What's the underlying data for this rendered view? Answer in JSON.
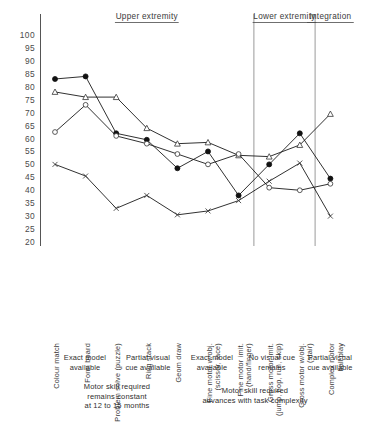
{
  "chart_data": {
    "type": "line",
    "title": "",
    "subtitle": "",
    "xlabel": "",
    "ylabel": "",
    "ylim": [
      20,
      100
    ],
    "ytick_step": 5,
    "grid": false,
    "legend_position": "none",
    "yticks": [
      "100",
      "95",
      "90",
      "85",
      "80",
      "75",
      "70",
      "65",
      "60",
      "55",
      "50",
      "45",
      "40",
      "35",
      "30",
      "25",
      "20"
    ],
    "categories": [
      "Colour match",
      "Form board",
      "Problem solve (puzzle)",
      "Ring stack",
      "Geom draw",
      "Fine motor w/obj. (scissor, lace)",
      "Fine motor imit. (hand/finger)",
      "Gross motor imit. (jump, hop, run, skip)",
      "Gross motor w/obj. (stair)",
      "Complex motor ball play"
    ],
    "category_lines": [
      [
        "Colour match"
      ],
      [
        "Form board"
      ],
      [
        "Problem solve (puzzle)"
      ],
      [
        "Ring stack"
      ],
      [
        "Geom draw"
      ],
      [
        "Fine motor w/obj.",
        "(scissor, lace)"
      ],
      [
        "Fine motor imit.",
        "(hand/finger)"
      ],
      [
        "Gross motor imit.",
        "(jump, hop, run, skip)"
      ],
      [
        "Gross motor w/obj.",
        "(stair)"
      ],
      [
        "Complex motor",
        "ball play"
      ]
    ],
    "series": [
      {
        "name": "filled-circle",
        "marker": "filled-circle",
        "values": [
          83,
          84,
          62,
          59.5,
          48.5,
          55,
          38,
          50,
          62,
          44.5
        ]
      },
      {
        "name": "open-triangle",
        "marker": "open-triangle",
        "values": [
          78,
          76,
          76,
          64,
          58,
          58.5,
          53.5,
          53,
          57.5,
          69.5
        ]
      },
      {
        "name": "open-circle",
        "marker": "open-circle",
        "values": [
          62.5,
          73,
          61,
          58,
          54,
          50,
          54,
          41,
          40,
          42.5
        ]
      },
      {
        "name": "cross-x",
        "marker": "cross-x",
        "values": [
          50,
          45.5,
          33,
          38,
          30.5,
          32,
          36,
          43.5,
          50.5,
          30
        ]
      }
    ],
    "sections": [
      {
        "label": "Upper extremity",
        "start_index": 0,
        "end_index": 6
      },
      {
        "label": "Lower extremity",
        "start_index": 7,
        "end_index": 8
      },
      {
        "label": "Integration",
        "start_index": 9,
        "end_index": 9
      }
    ],
    "condition_annotations": [
      {
        "lines": [
          "Exact model",
          "available"
        ]
      },
      {
        "lines": [
          "Partial visual",
          "cue available"
        ]
      },
      {
        "lines": [
          "Exact model",
          "available"
        ]
      },
      {
        "lines": [
          "No visual cue",
          "remains"
        ]
      },
      {
        "lines": [
          "Partial visual",
          "cue available"
        ]
      }
    ],
    "summary_annotations": [
      {
        "lines": [
          "Motor  skill required",
          "remains constant",
          "at 12 to 15 months"
        ]
      },
      {
        "lines": [
          "Motor skill required",
          "advances with task  complexity"
        ]
      }
    ]
  }
}
